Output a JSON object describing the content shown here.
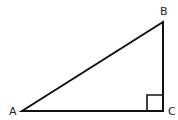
{
  "diagram": {
    "type": "right-triangle",
    "vertices": [
      {
        "id": "A",
        "label": "A",
        "x": 22,
        "y": 111
      },
      {
        "id": "B",
        "label": "B",
        "x": 163,
        "y": 22
      },
      {
        "id": "C",
        "label": "C",
        "x": 163,
        "y": 111
      }
    ],
    "right_angle_at": "C",
    "stroke_color": "#111111",
    "background": "#ffffff"
  }
}
